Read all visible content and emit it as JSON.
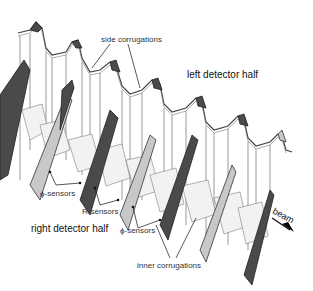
{
  "diagram": {
    "type": "3D technical illustration of a silicon vertex detector with corrugated RF foil",
    "labels": {
      "side_corrugations": "side corrugations",
      "left_detector_half": "left detector half",
      "phi_sensors_upper": "ϕ-sensors",
      "r_sensors": "R-sensors",
      "right_detector_half": "right detector half",
      "phi_sensors_lower": "ϕ-sensors",
      "inner_corrugations": "inner corrugations",
      "beam": "beam"
    },
    "colors": {
      "background": "#ffffff",
      "dark_sensor": "#4a4a4a",
      "light_sensor": "#c8c8c8",
      "outline": "#333333"
    }
  }
}
